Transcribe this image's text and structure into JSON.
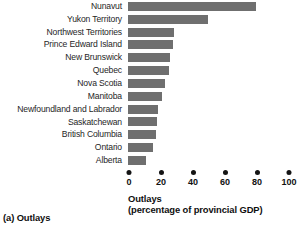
{
  "chart_data": {
    "type": "bar",
    "orientation": "horizontal",
    "title": "",
    "xlabel": "Outlays",
    "xlabel_line2": "(percentage of provincial GDP)",
    "ylabel": "",
    "xlim": [
      0,
      100
    ],
    "xticks": [
      0,
      20,
      40,
      60,
      80,
      100
    ],
    "xtick_labels": [
      "0",
      "20",
      "40",
      "60",
      "80",
      "100"
    ],
    "grid": false,
    "legend": null,
    "bar_color": "#6f6f6f",
    "categories": [
      "Nunavut",
      "Yukon Territory",
      "Northwest Territories",
      "Prince Edward Island",
      "New Brunswick",
      "Quebec",
      "Nova Scotia",
      "Manitoba",
      "Newfoundland and Labrador",
      "Saskatchewan",
      "British Columbia",
      "Ontario",
      "Alberta"
    ],
    "values": [
      80,
      50,
      28.5,
      28,
      26,
      25.5,
      23,
      21,
      19,
      18,
      17.5,
      15.5,
      11
    ]
  },
  "caption": "(a) Outlays"
}
